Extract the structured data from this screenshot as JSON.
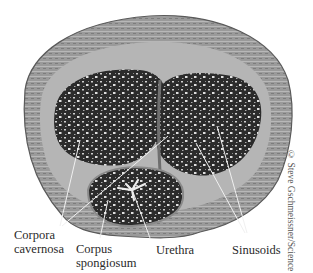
{
  "figure": {
    "labels": {
      "corpora_cavernosa_line1": "Corpora",
      "corpora_cavernosa_line2": "cavernosa",
      "corpus_spongiosum_line1": "Corpus",
      "corpus_spongiosum_line2": "spongiosum",
      "urethra": "Urethra",
      "sinusoids": "Sinusoids"
    },
    "credit": "© Steve Gschmeissner/Science Source",
    "colors": {
      "background": "#ffffff",
      "outer_tissue": "#8c8c8c",
      "tunica": "#b5b5b5",
      "erectile_tissue": "#2b2b2b",
      "sinusoid_spaces": "#d9d9d9",
      "leader_lines": "#e8e8e8",
      "label_text": "#2a2a2a"
    }
  }
}
